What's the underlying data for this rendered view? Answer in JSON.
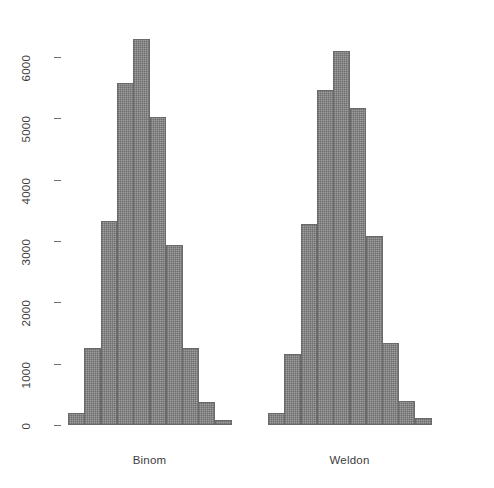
{
  "chart_data": {
    "type": "bar",
    "title": "",
    "subtitle": "",
    "xlabel": "",
    "ylabel": "",
    "ylim": [
      0,
      6500
    ],
    "grid": false,
    "legend": false,
    "y_ticks": [
      0,
      1000,
      2000,
      3000,
      4000,
      5000,
      6000
    ],
    "y_tick_labels": [
      "0",
      "1000",
      "2000",
      "3000",
      "4000",
      "5000",
      "6000"
    ],
    "categories": [
      "Binom",
      "Weldon"
    ],
    "groups": [
      {
        "name": "Binom",
        "label": "Binom",
        "bin_index": [
          1,
          2,
          3,
          4,
          5,
          6,
          7,
          8,
          9,
          10
        ],
        "values": [
          200,
          1250,
          3330,
          5580,
          6290,
          5020,
          2930,
          1250,
          370,
          80
        ]
      },
      {
        "name": "Weldon",
        "label": "Weldon",
        "bin_index": [
          1,
          2,
          3,
          4,
          5,
          6,
          7,
          8,
          9,
          10
        ],
        "values": [
          190,
          1150,
          3270,
          5470,
          6100,
          5170,
          3080,
          1340,
          390,
          110
        ]
      }
    ],
    "colors": {
      "bar_fill": "#9d9d9d",
      "bar_border": "#6a6a6a",
      "axis": "#6f6f6f",
      "text": "#3d3d3d",
      "background": "#ffffff"
    }
  }
}
